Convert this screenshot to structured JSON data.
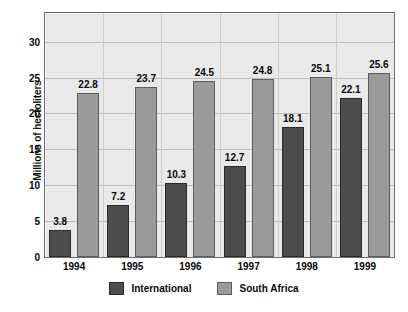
{
  "chart_data": {
    "type": "bar",
    "title": "",
    "xlabel": "",
    "ylabel": "Millions of hectoliters",
    "categories": [
      "1994",
      "1995",
      "1996",
      "1997",
      "1998",
      "1999"
    ],
    "series": [
      {
        "name": "International",
        "color": "#4d4d4d",
        "values": [
          3.8,
          7.2,
          10.3,
          12.7,
          18.1,
          22.1
        ]
      },
      {
        "name": "South Africa",
        "color": "#9a9a9a",
        "values": [
          22.8,
          23.7,
          24.5,
          24.8,
          25.1,
          25.6
        ]
      }
    ],
    "yticks": [
      0,
      5,
      10,
      15,
      20,
      25,
      30
    ],
    "ylim": [
      0,
      34
    ],
    "grid": true,
    "legend_position": "bottom",
    "plot_background": "#e9e9e9"
  }
}
